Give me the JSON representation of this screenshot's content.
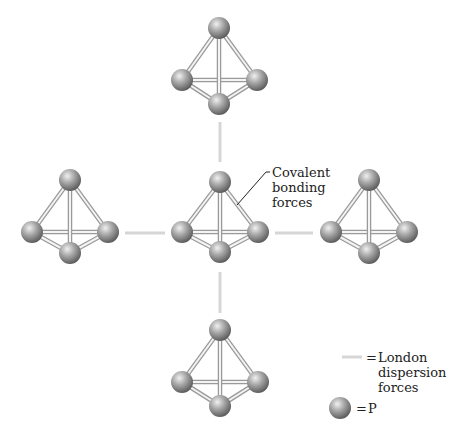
{
  "figure": {
    "colors": {
      "background": "#ffffff",
      "bond": "#c8c8c8",
      "bond_edge": "#9a9a9a",
      "dispersion": "#d6d6d6",
      "atom_light": "#e6e6e6",
      "atom_mid": "#9c9c9c",
      "atom_dark": "#5e5e5e",
      "text": "#222222"
    },
    "molecules": [
      {
        "name": "top",
        "atoms": [
          [
            219,
            28
          ],
          [
            182,
            80
          ],
          [
            257,
            80
          ],
          [
            219,
            104
          ]
        ]
      },
      {
        "name": "left",
        "atoms": [
          [
            70,
            180
          ],
          [
            32,
            232
          ],
          [
            108,
            232
          ],
          [
            70,
            253
          ]
        ]
      },
      {
        "name": "center",
        "atoms": [
          [
            220,
            182
          ],
          [
            182,
            232
          ],
          [
            258,
            232
          ],
          [
            220,
            252
          ]
        ]
      },
      {
        "name": "right",
        "atoms": [
          [
            369,
            180
          ],
          [
            331,
            232
          ],
          [
            407,
            232
          ],
          [
            369,
            253
          ]
        ]
      },
      {
        "name": "bottom",
        "atoms": [
          [
            220,
            330
          ],
          [
            182,
            382
          ],
          [
            258,
            382
          ],
          [
            220,
            406
          ]
        ]
      }
    ],
    "dispersion_lines": [
      [
        220,
        122,
        220,
        162
      ],
      [
        220,
        272,
        220,
        313
      ],
      [
        125,
        233,
        165,
        233
      ],
      [
        275,
        233,
        313,
        233
      ]
    ],
    "annotation": {
      "lines": [
        "Covalent",
        "bonding",
        "forces"
      ],
      "leader": [
        [
          237,
          205
        ],
        [
          266,
          172
        ],
        [
          270,
          172
        ]
      ]
    }
  },
  "legend": {
    "dispersion": {
      "symbol": "=",
      "lines": [
        "London",
        "dispersion",
        "forces"
      ]
    },
    "atom": {
      "symbol": "=",
      "label": "P"
    }
  }
}
